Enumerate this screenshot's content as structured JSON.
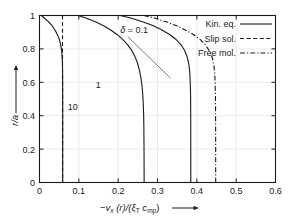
{
  "chart_data": {
    "type": "line",
    "title": "",
    "xlabel": "-v_x (r)/(ξ_T c_mp)",
    "ylabel": "r/a",
    "xlim": [
      0,
      0.6
    ],
    "ylim": [
      0,
      1
    ],
    "xticks": [
      "0",
      "0.1",
      "0.2",
      "0.3",
      "0.4",
      "0.5",
      "0.6"
    ],
    "xtick_values": [
      0,
      0.1,
      0.2,
      0.3,
      0.4,
      0.5,
      0.6
    ],
    "yticks": [
      "0",
      "0.2",
      "0.4",
      "0.6",
      "0.8",
      "1"
    ],
    "ytick_values": [
      0,
      0.2,
      0.4,
      0.6,
      0.8,
      1
    ],
    "grid": true,
    "legend_position": "top-right",
    "legend": [
      {
        "label": "Kin. eq.",
        "style": "solid"
      },
      {
        "label": "Slip sol.",
        "style": "dashed"
      },
      {
        "label": "Free mol.",
        "style": "dashdot"
      }
    ],
    "annotations": [
      {
        "text": "δ = 0.1",
        "x": 0.205,
        "y": 0.895,
        "leader_to": {
          "x": 0.333,
          "y": 0.625
        }
      },
      {
        "text": "1",
        "x": 0.143,
        "y": 0.565
      },
      {
        "text": "10",
        "x": 0.072,
        "y": 0.435
      }
    ],
    "series": [
      {
        "name": "Kin. eq. δ = 10",
        "style": "solid",
        "delta": 10,
        "points": [
          [
            0.005,
            1.0
          ],
          [
            0.012,
            0.985
          ],
          [
            0.022,
            0.965
          ],
          [
            0.031,
            0.942
          ],
          [
            0.038,
            0.918
          ],
          [
            0.044,
            0.893
          ],
          [
            0.049,
            0.866
          ],
          [
            0.0525,
            0.84
          ],
          [
            0.0548,
            0.812
          ],
          [
            0.0565,
            0.783
          ],
          [
            0.0575,
            0.752
          ],
          [
            0.0582,
            0.72
          ],
          [
            0.0586,
            0.68
          ],
          [
            0.0589,
            0.62
          ],
          [
            0.059,
            0.55
          ],
          [
            0.0591,
            0.45
          ],
          [
            0.0591,
            0.35
          ],
          [
            0.0591,
            0.2
          ],
          [
            0.0591,
            0.0
          ]
        ]
      },
      {
        "name": "Kin. eq. δ = 1",
        "style": "solid",
        "delta": 1,
        "points": [
          [
            0.098,
            1.0
          ],
          [
            0.118,
            0.985
          ],
          [
            0.142,
            0.963
          ],
          [
            0.163,
            0.938
          ],
          [
            0.182,
            0.912
          ],
          [
            0.198,
            0.885
          ],
          [
            0.212,
            0.856
          ],
          [
            0.224,
            0.826
          ],
          [
            0.234,
            0.793
          ],
          [
            0.242,
            0.758
          ],
          [
            0.2485,
            0.72
          ],
          [
            0.2535,
            0.678
          ],
          [
            0.2575,
            0.632
          ],
          [
            0.2605,
            0.582
          ],
          [
            0.2625,
            0.528
          ],
          [
            0.2638,
            0.47
          ],
          [
            0.2648,
            0.405
          ],
          [
            0.2653,
            0.335
          ],
          [
            0.2656,
            0.255
          ],
          [
            0.2658,
            0.17
          ],
          [
            0.2659,
            0.08
          ],
          [
            0.266,
            0.0
          ]
        ]
      },
      {
        "name": "Kin. eq. δ = 0.1",
        "style": "solid",
        "delta": 0.1,
        "points": [
          [
            0.205,
            1.0
          ],
          [
            0.232,
            0.985
          ],
          [
            0.262,
            0.963
          ],
          [
            0.288,
            0.94
          ],
          [
            0.31,
            0.915
          ],
          [
            0.33,
            0.888
          ],
          [
            0.3465,
            0.858
          ],
          [
            0.3595,
            0.826
          ],
          [
            0.369,
            0.79
          ],
          [
            0.3755,
            0.752
          ],
          [
            0.3795,
            0.71
          ],
          [
            0.3818,
            0.665
          ],
          [
            0.383,
            0.615
          ],
          [
            0.3838,
            0.56
          ],
          [
            0.3842,
            0.5
          ],
          [
            0.3844,
            0.43
          ],
          [
            0.3845,
            0.35
          ],
          [
            0.3846,
            0.25
          ],
          [
            0.3846,
            0.13
          ],
          [
            0.3846,
            0.0
          ]
        ]
      },
      {
        "name": "Slip sol.",
        "style": "dashed",
        "points": [
          [
            0.0585,
            1.0
          ],
          [
            0.0585,
            0.0
          ]
        ]
      },
      {
        "name": "Free mol.",
        "style": "dashdot",
        "points": [
          [
            0.265,
            1.0
          ],
          [
            0.292,
            0.985
          ],
          [
            0.322,
            0.962
          ],
          [
            0.349,
            0.938
          ],
          [
            0.372,
            0.912
          ],
          [
            0.392,
            0.885
          ],
          [
            0.409,
            0.855
          ],
          [
            0.4225,
            0.822
          ],
          [
            0.4325,
            0.785
          ],
          [
            0.4395,
            0.745
          ],
          [
            0.4435,
            0.7
          ],
          [
            0.4455,
            0.652
          ],
          [
            0.4465,
            0.6
          ],
          [
            0.4472,
            0.54
          ],
          [
            0.4475,
            0.47
          ],
          [
            0.4477,
            0.39
          ],
          [
            0.4478,
            0.3
          ],
          [
            0.4479,
            0.19
          ],
          [
            0.4479,
            0.08
          ],
          [
            0.448,
            0.0
          ]
        ]
      }
    ]
  },
  "axis_label_parts": {
    "x_minus": "−",
    "x_v": "v",
    "x_v_sub": "x",
    "x_r": " (r)/(",
    "x_xi": "ξ",
    "x_xi_sub": "T",
    "x_c": " c",
    "x_c_sub": "mp",
    "x_close": ")",
    "y_main": "r/a"
  },
  "colors": {
    "curve": "#1a1a1a",
    "grid": "#e6e6e6",
    "frame": "#1a1a1a",
    "background": "#ffffff"
  }
}
